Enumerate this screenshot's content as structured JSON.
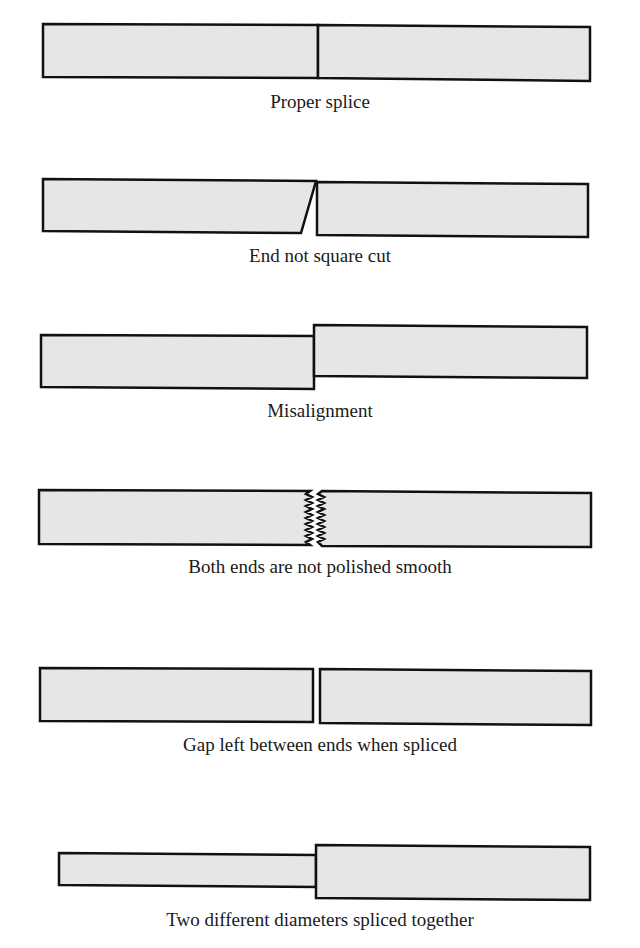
{
  "figure": {
    "fill_color": "#e6e6e6",
    "stroke_color": "#111111",
    "panels": [
      {
        "id": "proper",
        "caption": "Proper splice"
      },
      {
        "id": "not-square",
        "caption": "End not square cut"
      },
      {
        "id": "misalignment",
        "caption": "Misalignment"
      },
      {
        "id": "not-polished",
        "caption": "Both ends are not polished smooth"
      },
      {
        "id": "gap",
        "caption": "Gap left between ends when spliced"
      },
      {
        "id": "diameters",
        "caption": "Two different diameters spliced together"
      }
    ]
  }
}
